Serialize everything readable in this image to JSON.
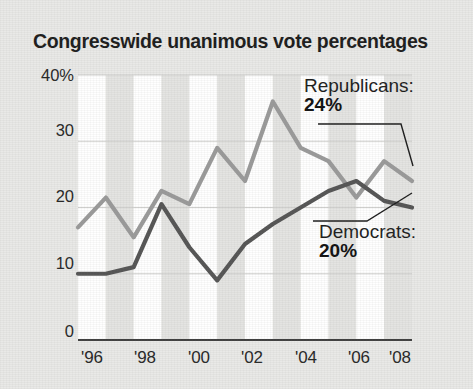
{
  "chart_data": {
    "type": "line",
    "title": "Congresswide unanimous vote percentages",
    "xlabel": "",
    "ylabel": "",
    "ylim": [
      0,
      40
    ],
    "xlim": [
      1996,
      2008
    ],
    "grid": true,
    "legend_position": "inline-annotations",
    "y_ticks": [
      "0",
      "10",
      "20",
      "30",
      "40%"
    ],
    "y_tick_values": [
      0,
      10,
      20,
      30,
      40
    ],
    "x_ticks": [
      "'96",
      "'98",
      "'00",
      "'02",
      "'04",
      "'06",
      "'08"
    ],
    "x_tick_values": [
      1996,
      1998,
      2000,
      2002,
      2004,
      2006,
      2008
    ],
    "x": [
      1996,
      1997,
      1998,
      1999,
      2000,
      2001,
      2002,
      2003,
      2004,
      2005,
      2006,
      2007,
      2008
    ],
    "series": [
      {
        "name": "Republicans",
        "color": "#9a9a9a",
        "end_label": "24%",
        "end_value": 24,
        "values": [
          17,
          21.5,
          15.5,
          22.5,
          20.5,
          29,
          24,
          36,
          29,
          27,
          21.5,
          27,
          24
        ]
      },
      {
        "name": "Democrats",
        "color": "#555555",
        "end_label": "20%",
        "end_value": 20,
        "values": [
          10,
          10,
          11,
          20.5,
          14,
          9,
          14.5,
          17.5,
          20,
          22.5,
          24,
          21,
          20
        ]
      }
    ],
    "annotations": [
      {
        "id": "republicans",
        "name": "Republicans:",
        "value": "24%"
      },
      {
        "id": "democrats",
        "name": "Democrats:",
        "value": "20%"
      }
    ]
  },
  "colors": {
    "background": "#e9e9e7",
    "plot_band_light": "#ffffff",
    "plot_band_dark": "#e4e4e2",
    "axis": "#4a4a4a",
    "gridline": "#cfcfcd",
    "republican": "#9a9a9a",
    "democrat": "#555555",
    "text": "#1c1c1c"
  }
}
